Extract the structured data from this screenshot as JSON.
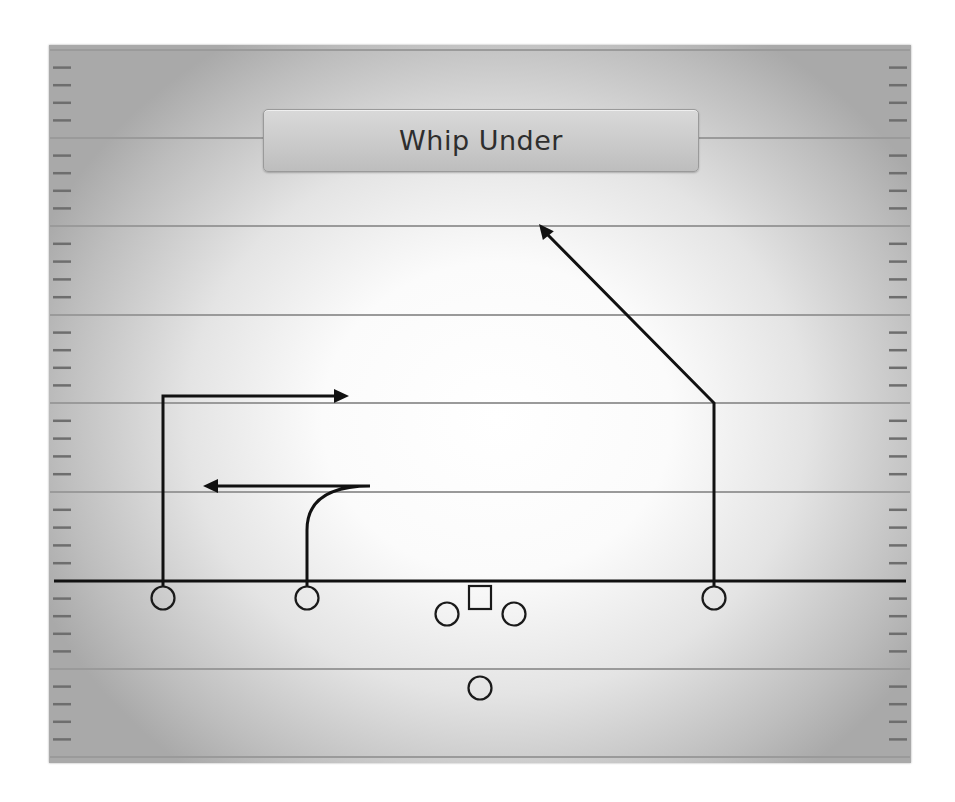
{
  "play": {
    "title": "Whip Under"
  },
  "field": {
    "yard_lines_y": [
      50,
      138,
      226,
      315,
      403,
      492,
      669,
      757
    ],
    "line_of_scrimmage_y": 581,
    "hash_marks_per_gap": 4,
    "colors": {
      "yard_line": "#9a9a9a",
      "hash_mark": "#6e6e6e",
      "route": "#111111",
      "player_outline": "#1a1a1a"
    }
  },
  "players": [
    {
      "id": "wr-left",
      "shape": "circle",
      "x": 163,
      "y": 598
    },
    {
      "id": "slot-left",
      "shape": "circle",
      "x": 307,
      "y": 598
    },
    {
      "id": "guard-left",
      "shape": "circle",
      "x": 447,
      "y": 614
    },
    {
      "id": "center",
      "shape": "square",
      "x": 480,
      "y": 598
    },
    {
      "id": "guard-right",
      "shape": "circle",
      "x": 514,
      "y": 614
    },
    {
      "id": "wr-right",
      "shape": "circle",
      "x": 714,
      "y": 598
    },
    {
      "id": "back",
      "shape": "circle",
      "x": 480,
      "y": 688
    }
  ],
  "routes": [
    {
      "player": "wr-left",
      "type": "in-route",
      "path": "M163 586 L163 396 L336 396",
      "arrow_tip": [
        349,
        396
      ],
      "direction": "right"
    },
    {
      "player": "slot-left",
      "type": "whip-under",
      "path": "M307 586 L307 530 Q307 486 370 486 L216 486",
      "arrow_tip": [
        203,
        486
      ],
      "direction": "left"
    },
    {
      "player": "wr-right",
      "type": "post",
      "path": "M714 586 L714 403 L547 234",
      "arrow_tip": [
        539,
        224
      ],
      "direction": "up-left"
    }
  ]
}
